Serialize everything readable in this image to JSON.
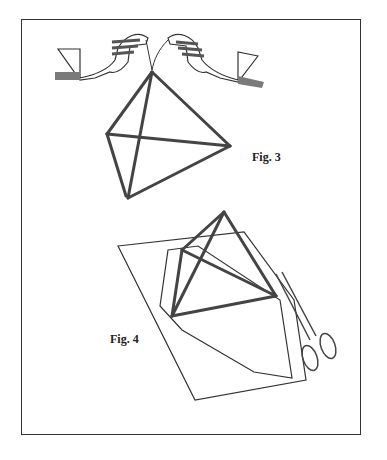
{
  "figures": [
    {
      "id": "fig3",
      "label": "Fig. 3",
      "description": "Two hands holding a tetrahedron made of straws by a string at its top vertex"
    },
    {
      "id": "fig4",
      "label": "Fig. 4",
      "description": "Tetrahedron placed on a sheet of paper with an outline traced and scissors cutting"
    }
  ],
  "colors": {
    "ink": "#333333",
    "straw_fill": "#8a8a8a",
    "hand_shade": "#7a7a7a",
    "background": "#ffffff"
  }
}
